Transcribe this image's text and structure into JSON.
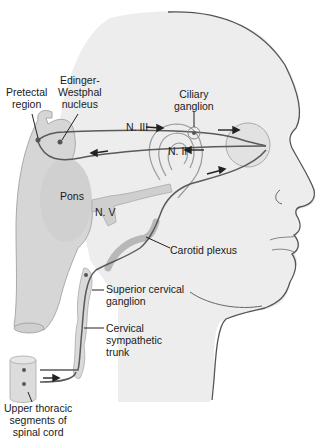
{
  "diagram": {
    "labels": {
      "pretectal": [
        "Pretectal",
        "region"
      ],
      "edinger": [
        "Edinger-",
        "Westphal",
        "nucleus"
      ],
      "ciliary": [
        "Ciliary",
        "ganglion"
      ],
      "n3": "N. III",
      "n2": "N. II",
      "pons": "Pons",
      "n5": "N. V",
      "carotid": "Carotid plexus",
      "superior": [
        "Superior cervical",
        "ganglion"
      ],
      "trunk": [
        "Cervical",
        "sympathetic",
        "trunk"
      ],
      "cord": [
        "Upper thoracic",
        "segments of",
        "spinal cord"
      ]
    },
    "colors": {
      "head_fill": "#ededed",
      "head_outline": "#555555",
      "structure_fill": "#d4d4d4",
      "nerve": "#5a5a5a",
      "text": "#1a1a1a"
    }
  }
}
